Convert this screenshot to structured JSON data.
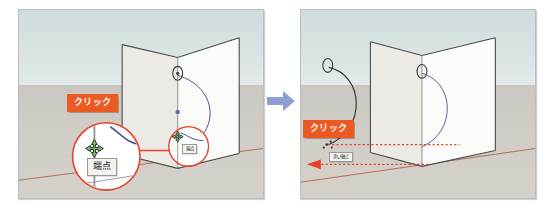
{
  "figure": {
    "panel_count": 2,
    "transition_icon": "right-arrow-icon",
    "transition_color": "#8b9fd4"
  },
  "colors": {
    "accent_orange": "#eb5a23",
    "inference_red": "#e8412a",
    "arc_blue": "#4a4f96",
    "axis_red": "#c0554a",
    "sky": "#d6e0e1",
    "ground": "#cfcdc5",
    "box_face_light": "#f2f1ec",
    "box_face_shade": "#e7e6e0",
    "box_edge": "#4a4a4a",
    "tooltip_bg": "#f4f3ef"
  },
  "panels": [
    {
      "id": "panel-left",
      "name": "before-drag",
      "labels": {
        "click_tag": "クリック",
        "zoom_tooltip": "端点",
        "small_tooltip": "端点"
      },
      "annotations": {
        "magnifier_count": 2,
        "cursor": "move-crosshair-cursor",
        "inference_point": "endpoint"
      }
    },
    {
      "id": "panel-right",
      "name": "after-drag",
      "labels": {
        "click_tag": "クリック",
        "axis_tooltip": "赤い軸上"
      },
      "annotations": {
        "cursor": "pencil-dot-cursor",
        "inference_line": "red-axis-dotted-line",
        "inference_point": "on-red-axis"
      }
    }
  ]
}
